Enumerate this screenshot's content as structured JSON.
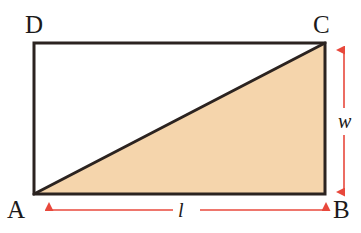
{
  "figure": {
    "type": "geometry-diagram",
    "shape": {
      "name": "rectangle",
      "vertices": [
        {
          "label": "D",
          "position": "top-left",
          "x": 34,
          "y": 43
        },
        {
          "label": "C",
          "position": "top-right",
          "x": 325,
          "y": 43
        },
        {
          "label": "B",
          "position": "bottom-right",
          "x": 325,
          "y": 194
        },
        {
          "label": "A",
          "position": "bottom-left",
          "x": 34,
          "y": 194
        }
      ],
      "diagonal": {
        "from": "A",
        "to": "C"
      },
      "shaded_region": {
        "name": "triangle-ABC",
        "vertices": [
          "A",
          "B",
          "C"
        ],
        "fill_color": "#f5d5ac"
      },
      "unshaded_region": {
        "name": "triangle-ACD",
        "vertices": [
          "A",
          "C",
          "D"
        ],
        "fill_color": "#ffffff"
      },
      "stroke_color": "#2b2320",
      "stroke_width": 3
    },
    "labels": {
      "vertex_d": "D",
      "vertex_c": "C",
      "vertex_a": "A",
      "vertex_b": "B",
      "length": "l",
      "width": "w"
    },
    "dimensions": [
      {
        "name": "length-dimension",
        "symbol": "l",
        "orientation": "horizontal",
        "measures": "AB",
        "arrow_color": "#e8483c",
        "double_headed": true
      },
      {
        "name": "width-dimension",
        "symbol": "w",
        "orientation": "vertical",
        "measures": "BC",
        "arrow_color": "#e8483c",
        "double_headed": true
      }
    ],
    "colors": {
      "background": "#ffffff",
      "shade": "#f5d5ac",
      "outline": "#2b2320",
      "arrow": "#e8483c"
    }
  }
}
